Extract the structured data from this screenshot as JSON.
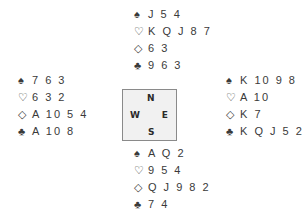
{
  "hands": {
    "north": {
      "spades": "J54",
      "hearts": "KQJ87",
      "diamonds": "63",
      "clubs": "963"
    },
    "west": {
      "spades": "763",
      "hearts": "632",
      "diamonds": "A1054",
      "clubs": "A108"
    },
    "east": {
      "spades": "K1098",
      "hearts": "A10",
      "diamonds": "K7",
      "clubs": "KQJ52"
    },
    "south": {
      "spades": "AQ2",
      "hearts": "954",
      "diamonds": "QJ982",
      "clubs": "74"
    }
  },
  "display": {
    "north": [
      "J 5 4",
      "K Q J 8 7",
      "6 3",
      "9 6 3"
    ],
    "west": [
      "7 6 3",
      "6 3 2",
      "A 10 5 4",
      "A 10 8"
    ],
    "east": [
      "K 10 9 8",
      "A 10",
      "K 7",
      "K Q J 5 2"
    ],
    "south": [
      "A Q 2",
      "9 5 4",
      "Q J 9 8 2",
      "7 4"
    ]
  },
  "suits": {
    "spade": "♠",
    "heart": "♡",
    "diamond": "◇",
    "club": "♣"
  },
  "compass": {
    "n": "N",
    "s": "S",
    "w": "W",
    "e": "E"
  }
}
